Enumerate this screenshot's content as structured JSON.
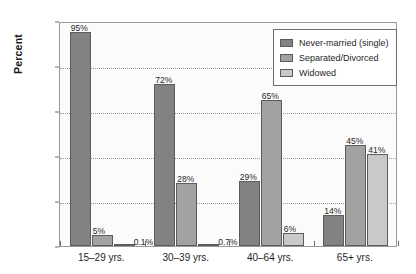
{
  "chart_data": {
    "type": "bar",
    "title": "",
    "xlabel": "",
    "ylabel": "Percent",
    "ylim": [
      0,
      100
    ],
    "yticks": [
      0,
      20,
      40,
      60,
      80,
      100
    ],
    "ytick_labels": [
      "0",
      "20",
      "40",
      "60",
      "80",
      "100"
    ],
    "grid": "horizontal-dotted",
    "legend_position": "top-right-inside",
    "categories": [
      "15–29 yrs.",
      "30–39 yrs.",
      "40–64 yrs.",
      "65+ yrs."
    ],
    "series": [
      {
        "name": "Never-married (single)",
        "color": "#828282",
        "values": [
          95,
          72,
          29,
          14
        ],
        "labels": [
          "95%",
          "72%",
          "29%",
          "14%"
        ]
      },
      {
        "name": "Separated/Divorced",
        "color": "#a2a2a2",
        "values": [
          5,
          28,
          65,
          45
        ],
        "labels": [
          "5%",
          "28%",
          "65%",
          "45%"
        ]
      },
      {
        "name": "Widowed",
        "color": "#c9c9c9",
        "values": [
          0.1,
          0.7,
          6,
          41
        ],
        "labels": [
          "0.1%",
          "0.7%",
          "6%",
          "41%"
        ]
      }
    ]
  },
  "legend": {
    "items": [
      {
        "label": "Never-married (single)"
      },
      {
        "label": "Separated/Divorced"
      },
      {
        "label": "Widowed"
      }
    ]
  }
}
